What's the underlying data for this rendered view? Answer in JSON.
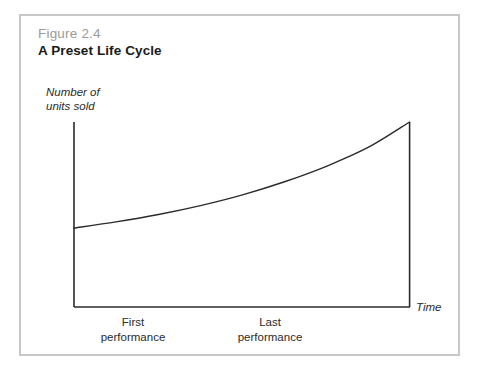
{
  "figure": {
    "number": "Figure 2.4",
    "title": "A Preset Life Cycle",
    "number_color": "#9a9a9a",
    "title_color": "#1a1a1a",
    "frame_color": "#c8c8c8",
    "background_color": "#ffffff"
  },
  "chart_data": {
    "type": "line",
    "title": "A Preset Life Cycle",
    "xlabel": "Time",
    "ylabel": "Number of units sold",
    "ylabel_line1": "Number of",
    "ylabel_line2": "units sold",
    "grid": false,
    "legend": "none",
    "axis_color": "#2b2b2b",
    "curve_color": "#2b2b2b",
    "xlim": [
      0,
      100
    ],
    "ylim": [
      0,
      100
    ],
    "x_tick_labels": [
      {
        "label_line1": "First",
        "label_line2": "performance",
        "x": 17.6
      },
      {
        "label_line1": "Last",
        "label_line2": "performance",
        "x": 58.3
      }
    ],
    "annotations": [
      {
        "name": "end-drop-line",
        "x": 71.1,
        "y_from": 100,
        "y_to": 0
      }
    ],
    "series": [
      {
        "name": "units sold",
        "x": [
          0,
          8.9,
          17.9,
          26.8,
          35.7,
          44.6,
          53.6,
          62.5,
          71.1
        ],
        "y": [
          42.7,
          46.0,
          50.0,
          54.8,
          60.6,
          67.7,
          76.2,
          86.5,
          100.0
        ]
      }
    ]
  }
}
